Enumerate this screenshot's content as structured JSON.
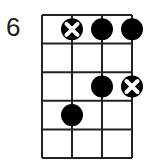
{
  "diagram": {
    "type": "chord-diagram",
    "starting_fret_label": "6",
    "strings": 4,
    "frets_shown": 5,
    "grid": {
      "x0": 42,
      "y0": 15,
      "col_w": 30,
      "row_h": 28.6
    },
    "markers": [
      {
        "string": 1,
        "fret": 1,
        "type": "x-dot"
      },
      {
        "string": 2,
        "fret": 1,
        "type": "dot"
      },
      {
        "string": 3,
        "fret": 1,
        "type": "dot"
      },
      {
        "string": 2,
        "fret": 3,
        "type": "dot"
      },
      {
        "string": 3,
        "fret": 3,
        "type": "x-dot"
      },
      {
        "string": 1,
        "fret": 4,
        "type": "dot"
      }
    ],
    "colors": {
      "line": "#222222",
      "dot": "#000000",
      "x_mark": "#ffffff"
    }
  }
}
